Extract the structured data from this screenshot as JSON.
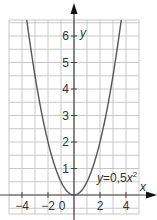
{
  "chart_data": {
    "type": "line",
    "title": "",
    "xlabel": "x",
    "ylabel": "y",
    "xlim": [
      -5,
      5
    ],
    "ylim": [
      -0.7,
      6.6
    ],
    "grid": true,
    "x_tick_labels": [
      "−4",
      "−2",
      "0",
      "2",
      "4"
    ],
    "x_ticks": [
      -4,
      -2,
      0,
      2,
      4
    ],
    "y_tick_labels": [
      "1",
      "2",
      "3",
      "4",
      "5",
      "6"
    ],
    "y_ticks": [
      1,
      2,
      3,
      4,
      5,
      6
    ],
    "series": [
      {
        "name": "y=0,5x²",
        "function": "y = 0.5*x^2",
        "x": [
          -3.6,
          -3,
          -2,
          -1,
          0,
          1,
          2,
          3,
          3.6
        ],
        "values": [
          6.48,
          4.5,
          2,
          0.5,
          0,
          0.5,
          2,
          4.5,
          6.48
        ],
        "color": "#555555"
      }
    ],
    "annotations": [
      {
        "text_prefix": "y",
        "text_mid": "=0,5",
        "text_var": "x",
        "text_sup": "2",
        "x": 0.5,
        "y": 1.2
      }
    ]
  },
  "colors": {
    "grid": "#c8c8c8",
    "axis": "#444444",
    "curve": "#555555"
  }
}
